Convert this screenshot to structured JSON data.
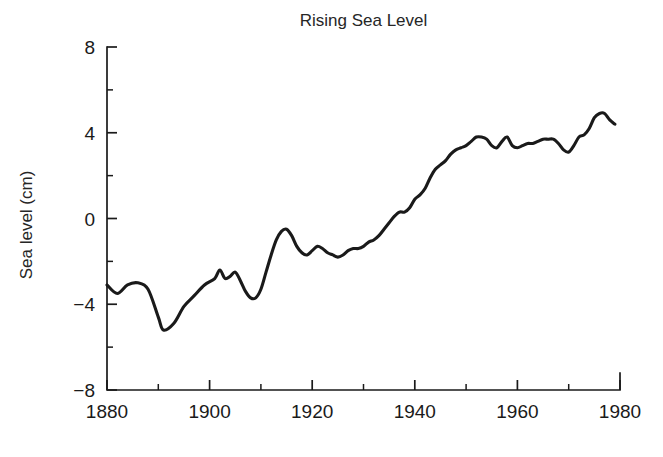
{
  "chart_data": {
    "type": "line",
    "title": "Rising Sea Level",
    "xlabel": "",
    "ylabel": "Sea level (cm)",
    "xlim": [
      1880,
      1980
    ],
    "ylim": [
      -8,
      8
    ],
    "grid": false,
    "legend": null,
    "x_major_ticks": [
      1880,
      1900,
      1920,
      1940,
      1960,
      1980
    ],
    "x_major_tick_labels": [
      "1880",
      "1900",
      "1920",
      "1940",
      "1960",
      "1980"
    ],
    "x_minor_ticks": [
      1890,
      1910,
      1930,
      1950,
      1970
    ],
    "y_major_ticks": [
      -8,
      -4,
      0,
      4,
      8
    ],
    "y_major_tick_labels": [
      "−8",
      "−4",
      "0",
      "4",
      "8"
    ],
    "y_minor_ticks": [
      -6,
      -2,
      2,
      6
    ],
    "line_color": "#1a1a1a",
    "series": [
      {
        "name": "Sea level",
        "x": [
          1880,
          1882,
          1884,
          1886,
          1888,
          1890,
          1891,
          1893,
          1895,
          1897,
          1899,
          1901,
          1902,
          1903,
          1904,
          1905,
          1906,
          1907,
          1908,
          1909,
          1910,
          1911,
          1912,
          1913,
          1914,
          1915,
          1916,
          1917,
          1918,
          1919,
          1920,
          1921,
          1922,
          1923,
          1924,
          1925,
          1926,
          1927,
          1928,
          1929,
          1930,
          1931,
          1932,
          1933,
          1934,
          1935,
          1936,
          1937,
          1938,
          1939,
          1940,
          1941,
          1942,
          1943,
          1944,
          1945,
          1946,
          1947,
          1948,
          1949,
          1950,
          1951,
          1952,
          1953,
          1954,
          1955,
          1956,
          1957,
          1958,
          1959,
          1960,
          1961,
          1962,
          1963,
          1964,
          1965,
          1966,
          1967,
          1968,
          1969,
          1970,
          1971,
          1972,
          1973,
          1974,
          1975,
          1976,
          1977,
          1978,
          1979
        ],
        "values": [
          -3.1,
          -3.5,
          -3.1,
          -3.0,
          -3.3,
          -4.6,
          -5.2,
          -4.9,
          -4.1,
          -3.6,
          -3.1,
          -2.8,
          -2.4,
          -2.8,
          -2.7,
          -2.5,
          -2.9,
          -3.4,
          -3.7,
          -3.7,
          -3.3,
          -2.5,
          -1.7,
          -1.0,
          -0.6,
          -0.5,
          -0.8,
          -1.3,
          -1.6,
          -1.7,
          -1.5,
          -1.3,
          -1.4,
          -1.6,
          -1.7,
          -1.8,
          -1.7,
          -1.5,
          -1.4,
          -1.4,
          -1.3,
          -1.1,
          -1.0,
          -0.8,
          -0.5,
          -0.2,
          0.1,
          0.3,
          0.3,
          0.5,
          0.9,
          1.1,
          1.4,
          1.9,
          2.3,
          2.5,
          2.7,
          3.0,
          3.2,
          3.3,
          3.4,
          3.6,
          3.8,
          3.8,
          3.7,
          3.4,
          3.3,
          3.6,
          3.8,
          3.4,
          3.3,
          3.4,
          3.5,
          3.5,
          3.6,
          3.7,
          3.7,
          3.7,
          3.5,
          3.2,
          3.1,
          3.4,
          3.8,
          3.9,
          4.2,
          4.7,
          4.9,
          4.9,
          4.6,
          4.4
        ]
      }
    ]
  },
  "figure": {
    "title": "Rising Sea Level",
    "ylabel": "Sea level (cm)"
  }
}
